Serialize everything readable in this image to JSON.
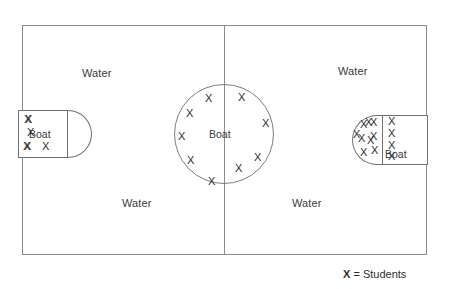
{
  "diagram": {
    "frame": {
      "stroke": "#8b8b8b"
    },
    "water_labels": [
      {
        "id": "water-top-left",
        "text": "Water"
      },
      {
        "id": "water-bottom-left",
        "text": "Water"
      },
      {
        "id": "water-top-right",
        "text": "Water"
      },
      {
        "id": "water-bottom-right",
        "text": "Water"
      }
    ],
    "left_boat": {
      "label": "Boat",
      "marker": "X",
      "student_count": 6,
      "rect_markers": [
        {
          "x": 7,
          "y": 4,
          "text": "X"
        },
        {
          "x": 5,
          "y": 31,
          "text": "X"
        },
        {
          "x": 24,
          "y": 31,
          "text": "X"
        }
      ],
      "cap_markers": [
        {
          "x": 6,
          "y": 4,
          "text": "X"
        },
        {
          "x": 9,
          "y": 17,
          "text": "X"
        },
        {
          "x": 6,
          "y": 31,
          "text": "X"
        }
      ]
    },
    "center_boat": {
      "label": "Boat",
      "marker": "X",
      "student_count": 9,
      "markers": [
        {
          "x": 205,
          "y": 93,
          "text": "X"
        },
        {
          "x": 238,
          "y": 92,
          "text": "X"
        },
        {
          "x": 186,
          "y": 108,
          "text": "X"
        },
        {
          "x": 262,
          "y": 118,
          "text": "X"
        },
        {
          "x": 178,
          "y": 131,
          "text": "X"
        },
        {
          "x": 187,
          "y": 155,
          "text": "X"
        },
        {
          "x": 254,
          "y": 152,
          "text": "X"
        },
        {
          "x": 235,
          "y": 163,
          "text": "X"
        },
        {
          "x": 208,
          "y": 176,
          "text": "X"
        }
      ]
    },
    "right_boat": {
      "label": "Boat",
      "marker": "X",
      "student_count": 13,
      "cap_markers": [
        {
          "x": 8,
          "y": 4,
          "text": "X"
        },
        {
          "x": 18,
          "y": 2,
          "text": "X"
        },
        {
          "x": 6,
          "y": 18,
          "text": "X"
        },
        {
          "x": 18,
          "y": 16,
          "text": "X"
        },
        {
          "x": 8,
          "y": 32,
          "text": "X"
        },
        {
          "x": 19,
          "y": 30,
          "text": "X"
        }
      ],
      "rect_markers": [
        {
          "x": 1,
          "y": 14,
          "text": "X"
        },
        {
          "x": 13,
          "y": 2,
          "text": "X"
        },
        {
          "x": 15,
          "y": 20,
          "text": "X"
        },
        {
          "x": 36,
          "y": 1,
          "text": "X"
        },
        {
          "x": 36,
          "y": 13,
          "text": "X"
        },
        {
          "x": 36,
          "y": 25,
          "text": "X"
        },
        {
          "x": 36,
          "y": 36,
          "text": "X"
        }
      ]
    },
    "legend": {
      "marker": "X",
      "separator": " = ",
      "description": "Students"
    }
  }
}
